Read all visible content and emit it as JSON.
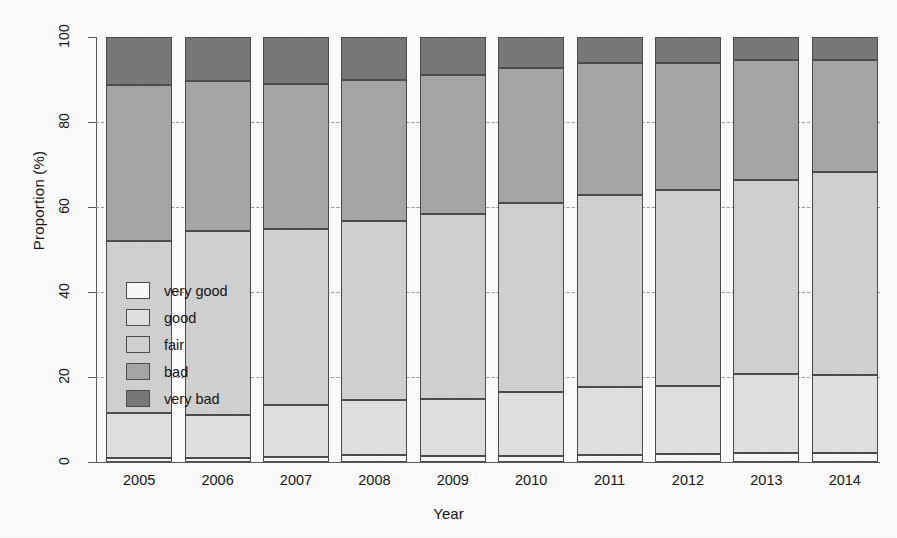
{
  "chart_data": {
    "type": "bar",
    "subtype": "stacked-percentage",
    "title": "",
    "xlabel": "Year",
    "ylabel": "Proportion (%)",
    "ylim": [
      0,
      100
    ],
    "yticks": [
      0,
      20,
      40,
      60,
      80,
      100
    ],
    "grid": "horizontal-dashed",
    "legend_position": "inside-left",
    "categories": [
      "2005",
      "2006",
      "2007",
      "2008",
      "2009",
      "2010",
      "2011",
      "2012",
      "2013",
      "2014"
    ],
    "series": [
      {
        "name": "very good",
        "color": "#fbfbfb",
        "values": [
          1.0,
          1.0,
          1.2,
          1.6,
          1.5,
          1.4,
          1.6,
          2.0,
          2.1,
          2.1
        ]
      },
      {
        "name": "good",
        "color": "#e3e3e3",
        "values": [
          10.6,
          10.0,
          12.2,
          12.9,
          13.3,
          15.0,
          16.0,
          15.9,
          18.7,
          18.4
        ]
      },
      {
        "name": "fair",
        "color": "#d3d3d3",
        "values": [
          40.3,
          43.4,
          41.5,
          42.1,
          43.6,
          44.5,
          45.3,
          46.1,
          45.5,
          47.8
        ]
      },
      {
        "name": "bad",
        "color": "#a8a8a8",
        "values": [
          36.9,
          35.3,
          34.1,
          33.4,
          32.7,
          31.8,
          31.0,
          29.9,
          28.4,
          26.4
        ]
      },
      {
        "name": "very bad",
        "color": "#7a7a7a",
        "values": [
          11.2,
          10.3,
          11.0,
          10.0,
          8.9,
          7.3,
          6.1,
          6.1,
          5.3,
          5.3
        ]
      }
    ],
    "stack_boundaries": {
      "2005": [
        1.0,
        11.6,
        51.9,
        88.8,
        100.0
      ],
      "2006": [
        1.0,
        11.0,
        54.4,
        89.7,
        100.0
      ],
      "2007": [
        1.2,
        13.4,
        54.9,
        89.0,
        100.0
      ],
      "2008": [
        1.6,
        14.5,
        56.6,
        90.0,
        100.0
      ],
      "2009": [
        1.5,
        14.8,
        58.4,
        91.1,
        100.0
      ],
      "2010": [
        1.4,
        16.4,
        60.9,
        92.7,
        100.0
      ],
      "2011": [
        1.6,
        17.6,
        62.9,
        93.9,
        100.0
      ],
      "2012": [
        2.0,
        17.9,
        64.0,
        93.9,
        100.0
      ],
      "2013": [
        2.1,
        20.8,
        66.3,
        94.7,
        100.0
      ],
      "2014": [
        2.1,
        20.5,
        68.3,
        94.7,
        100.0
      ]
    }
  },
  "axes": {
    "y_label": "Proportion (%)",
    "x_label": "Year",
    "y_tick_labels": [
      "0",
      "20",
      "40",
      "60",
      "80",
      "100"
    ],
    "x_tick_labels": [
      "2005",
      "2006",
      "2007",
      "2008",
      "2009",
      "2010",
      "2011",
      "2012",
      "2013",
      "2014"
    ]
  },
  "legend": {
    "items": [
      {
        "label": "very good",
        "color": "#fbfbfb"
      },
      {
        "label": "good",
        "color": "#e3e3e3"
      },
      {
        "label": "fair",
        "color": "#d3d3d3"
      },
      {
        "label": "bad",
        "color": "#a8a8a8"
      },
      {
        "label": "very bad",
        "color": "#7a7a7a"
      }
    ]
  }
}
